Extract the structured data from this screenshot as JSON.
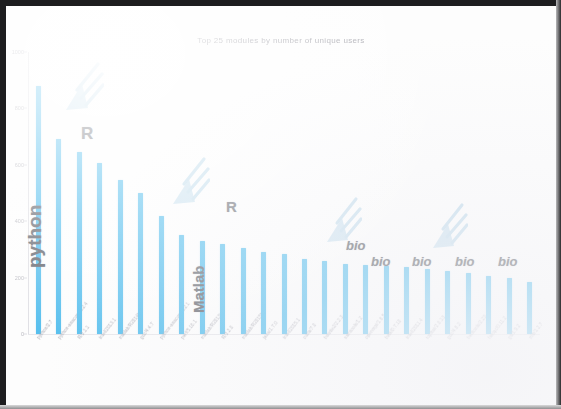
{
  "figure": {
    "title": "Top 25 modules by number of unique users",
    "bar_color": "#4fbced",
    "annotation_color": "#5d6068",
    "arrow_color": "#bcd9ea"
  },
  "chart_data": {
    "type": "bar",
    "title": "Top 25 modules by number of unique users",
    "xlabel": "",
    "ylabel": "",
    "grid": false,
    "legend": null,
    "ylim": [
      0,
      1000
    ],
    "yticks": [
      "1000",
      "800",
      "600",
      "400",
      "200",
      "0"
    ],
    "categories": [
      "python/2.7",
      "python-anaconda/2.4",
      "R/3.1.1",
      "intel/2013.1",
      "matlab/R2014b",
      "gcc/4.4.7",
      "python-anaconda/2.1",
      "perl/5.16.1",
      "matlab/R2013a",
      "R/3.2.0",
      "matlab/R2015b",
      "java/1.7.0",
      "intel/2015.1",
      "cuda/7.0",
      "bowtie2/2.2.3",
      "samtools/1.2",
      "openmpi/1.6.5",
      "bwa/0.7.10",
      "intel/2011.4",
      "tophat/2.0.13",
      "gcc/4.8.2",
      "bedtools/2.23",
      "fastqc/0.11.2",
      "git/1.9.2",
      "zlib/1.2.7"
    ],
    "values": [
      880,
      690,
      645,
      605,
      545,
      500,
      420,
      350,
      330,
      320,
      305,
      290,
      285,
      265,
      260,
      250,
      245,
      240,
      238,
      232,
      225,
      215,
      205,
      200,
      185
    ]
  },
  "annotations": {
    "labels": [
      {
        "text": "python",
        "style": "vertical-bold"
      },
      {
        "text": "R",
        "style": "bold"
      },
      {
        "text": "Matlab",
        "style": "vertical-bold"
      },
      {
        "text": "R",
        "style": "bold"
      },
      {
        "text": "bio",
        "style": "italic"
      },
      {
        "text": "bio",
        "style": "italic"
      },
      {
        "text": "bio",
        "style": "italic"
      },
      {
        "text": "bio",
        "style": "italic"
      },
      {
        "text": "bio",
        "style": "italic"
      }
    ],
    "arrows": [
      {
        "name": "arrow-to-python-anaconda"
      },
      {
        "name": "arrow-to-python-anaconda-2"
      },
      {
        "name": "arrow-to-bio-group-1"
      },
      {
        "name": "arrow-to-bio-group-2"
      }
    ]
  }
}
